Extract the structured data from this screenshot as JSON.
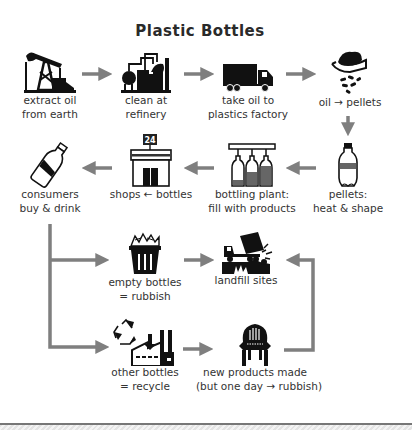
{
  "title": "Plastic Bottles",
  "colors": {
    "arrow": "#7f7f7f",
    "icon": "#111111",
    "text": "#333333"
  },
  "steps": [
    {
      "id": "extract",
      "icon": "oil-pump-icon",
      "lines": [
        "extract oil",
        "from earth"
      ]
    },
    {
      "id": "refinery",
      "icon": "refinery-icon",
      "lines": [
        "clean at",
        "refinery"
      ]
    },
    {
      "id": "transport",
      "icon": "truck-icon",
      "lines": [
        "take oil to",
        "plastics factory"
      ]
    },
    {
      "id": "pellets",
      "icon": "hand-pellets-icon",
      "lines": [
        "oil → pellets"
      ]
    },
    {
      "id": "shape",
      "icon": "bottle-icon",
      "lines": [
        "pellets:",
        "heat & shape"
      ]
    },
    {
      "id": "bottling",
      "icon": "bottling-line-icon",
      "lines": [
        "bottling plant:",
        "fill with products"
      ]
    },
    {
      "id": "shops",
      "icon": "shop-icon",
      "badge": "24",
      "lines": [
        "shops ← bottles"
      ]
    },
    {
      "id": "consumers",
      "icon": "drink-bottle-icon",
      "lines": [
        "consumers",
        "buy & drink"
      ]
    },
    {
      "id": "rubbish",
      "icon": "trash-bin-icon",
      "lines": [
        "empty bottles",
        "= rubbish"
      ]
    },
    {
      "id": "landfill",
      "icon": "dump-truck-icon",
      "lines": [
        "landfill sites"
      ]
    },
    {
      "id": "recycle",
      "icon": "recycle-factory-icon",
      "lines": [
        "other bottles",
        "= recycle"
      ]
    },
    {
      "id": "products",
      "icon": "chair-icon",
      "lines": [
        "new products made",
        "(but one day → rubbish)"
      ]
    }
  ],
  "flow": [
    [
      "extract",
      "refinery"
    ],
    [
      "refinery",
      "transport"
    ],
    [
      "transport",
      "pellets"
    ],
    [
      "pellets",
      "shape"
    ],
    [
      "shape",
      "bottling"
    ],
    [
      "bottling",
      "shops"
    ],
    [
      "shops",
      "consumers"
    ],
    [
      "consumers",
      "rubbish"
    ],
    [
      "consumers",
      "recycle"
    ],
    [
      "rubbish",
      "landfill"
    ],
    [
      "recycle",
      "products"
    ],
    [
      "products",
      "landfill"
    ]
  ]
}
